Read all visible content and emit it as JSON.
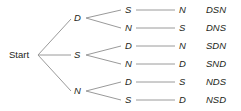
{
  "diagram": {
    "type": "tree",
    "root": "Start",
    "line_color": "#9a9a9a",
    "level1": [
      {
        "label": "D",
        "y": 18
      },
      {
        "label": "S",
        "y": 55
      },
      {
        "label": "N",
        "y": 91
      }
    ],
    "paths": [
      {
        "l1": "D",
        "l2": "S",
        "l3": "N",
        "code": "DSN",
        "y": 10
      },
      {
        "l1": "D",
        "l2": "N",
        "l3": "S",
        "code": "DNS",
        "y": 28
      },
      {
        "l1": "S",
        "l2": "D",
        "l3": "N",
        "code": "SDN",
        "y": 46
      },
      {
        "l1": "S",
        "l2": "N",
        "l3": "D",
        "code": "SND",
        "y": 64
      },
      {
        "l1": "N",
        "l2": "D",
        "l3": "S",
        "code": "NDS",
        "y": 82
      },
      {
        "l1": "N",
        "l2": "S",
        "l3": "D",
        "code": "NSD",
        "y": 100
      }
    ]
  }
}
